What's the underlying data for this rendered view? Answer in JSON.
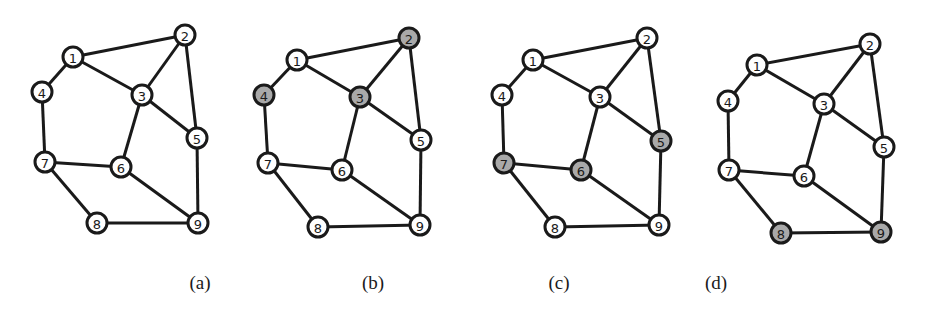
{
  "edges": [
    [
      1,
      2
    ],
    [
      1,
      3
    ],
    [
      1,
      4
    ],
    [
      2,
      3
    ],
    [
      2,
      5
    ],
    [
      3,
      5
    ],
    [
      3,
      6
    ],
    [
      4,
      7
    ],
    [
      7,
      6
    ],
    [
      7,
      8
    ],
    [
      6,
      9
    ],
    [
      5,
      9
    ],
    [
      8,
      9
    ]
  ],
  "colors": {
    "shaded": "#a9a9a9",
    "unshaded": "#ffffff",
    "stroke": "#1a1a1a"
  },
  "panels": [
    {
      "label": "(a)",
      "label_x": 200,
      "shaded": [],
      "nodes": {
        "1": [
          73,
          57
        ],
        "2": [
          185,
          35
        ],
        "3": [
          142,
          95
        ],
        "4": [
          42,
          92
        ],
        "5": [
          197,
          138
        ],
        "6": [
          121,
          167
        ],
        "7": [
          45,
          162
        ],
        "8": [
          97,
          223
        ],
        "9": [
          198,
          223
        ]
      }
    },
    {
      "label": "(b)",
      "label_x": 373,
      "shaded": [
        2,
        3,
        4
      ],
      "nodes": {
        "1": [
          297,
          60
        ],
        "2": [
          409,
          38
        ],
        "3": [
          360,
          97
        ],
        "4": [
          264,
          95
        ],
        "5": [
          421,
          140
        ],
        "6": [
          342,
          170
        ],
        "7": [
          268,
          163
        ],
        "8": [
          318,
          227
        ],
        "9": [
          420,
          225
        ]
      }
    },
    {
      "label": "(c)",
      "label_x": 559,
      "shaded": [
        5,
        6,
        7
      ],
      "nodes": {
        "1": [
          533,
          60
        ],
        "2": [
          647,
          38
        ],
        "3": [
          600,
          97
        ],
        "4": [
          502,
          95
        ],
        "5": [
          661,
          141
        ],
        "6": [
          581,
          170
        ],
        "7": [
          504,
          163
        ],
        "8": [
          555,
          227
        ],
        "9": [
          659,
          225
        ]
      }
    },
    {
      "label": "(d)",
      "label_x": 716,
      "shaded": [
        8,
        9
      ],
      "nodes": {
        "1": [
          757,
          65
        ],
        "2": [
          870,
          44
        ],
        "3": [
          824,
          104
        ],
        "4": [
          728,
          101
        ],
        "5": [
          884,
          147
        ],
        "6": [
          804,
          176
        ],
        "7": [
          729,
          170
        ],
        "8": [
          781,
          233
        ],
        "9": [
          881,
          232
        ]
      }
    }
  ]
}
